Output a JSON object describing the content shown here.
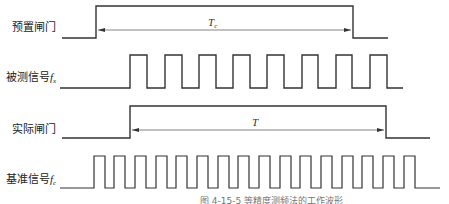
{
  "diagram": {
    "type": "timing-diagram",
    "signals": [
      {
        "id": "preset_gate",
        "label": "预置闸门",
        "symbol": ""
      },
      {
        "id": "measured_signal",
        "label": "被测信号",
        "symbol": "f",
        "subscript": "x"
      },
      {
        "id": "actual_gate",
        "label": "实际闸门",
        "symbol": ""
      },
      {
        "id": "reference_signal",
        "label": "基准信号",
        "symbol": "f",
        "subscript": "c"
      }
    ],
    "intervals": [
      {
        "name": "preset-gate-duration",
        "symbol": "T",
        "subscript": "c"
      },
      {
        "name": "actual-gate-duration",
        "symbol": "T",
        "subscript": ""
      }
    ],
    "caption": "图 4-15-5  等精度测频法的工作波形"
  },
  "colors": {
    "line": "#333333",
    "arrow": "#555555",
    "text": "#222222"
  }
}
